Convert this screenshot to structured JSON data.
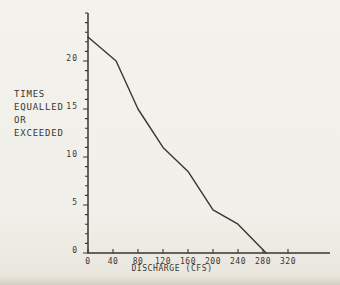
{
  "page": {
    "paper_color": "#f1efe9",
    "ink_color": "#3a362d"
  },
  "chart_data": {
    "type": "line",
    "y_axis_label_lines": [
      "TIMES",
      "EQUALLED",
      "OR",
      "EXCEEDED"
    ],
    "x_axis_label": "DISCHARGE (CFS)",
    "x_tick_values": [
      0,
      40,
      80,
      120,
      160,
      200,
      240,
      280,
      320
    ],
    "x_tick_labels": [
      "0",
      "40",
      "80",
      "120",
      "160",
      "200",
      "240",
      "280",
      "320"
    ],
    "y_tick_values": [
      0,
      5,
      10,
      15,
      20
    ],
    "y_tick_labels": [
      "0",
      "5",
      "10",
      "15",
      "20"
    ],
    "y_minor_tick_step": 1,
    "xlim": [
      0,
      388
    ],
    "ylim": [
      0,
      25
    ],
    "grid": false,
    "series": [
      {
        "name": "times-equalled-or-exceeded-vs-discharge",
        "points": [
          [
            0,
            22.5
          ],
          [
            45,
            20
          ],
          [
            80,
            15
          ],
          [
            120,
            11
          ],
          [
            160,
            8.5
          ],
          [
            200,
            4.5
          ],
          [
            240,
            3
          ],
          [
            285,
            0
          ]
        ]
      }
    ]
  }
}
